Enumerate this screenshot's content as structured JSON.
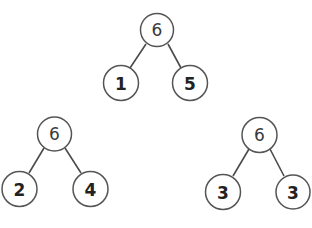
{
  "diagram": {
    "type": "number-bonds",
    "trees": [
      {
        "whole": "6",
        "parts": [
          "1",
          "5"
        ]
      },
      {
        "whole": "6",
        "parts": [
          "2",
          "4"
        ]
      },
      {
        "whole": "6",
        "parts": [
          "3",
          "3"
        ]
      }
    ]
  },
  "colors": {
    "stroke": "#555555",
    "edge": "#4a4a4a",
    "text": "#222222"
  }
}
